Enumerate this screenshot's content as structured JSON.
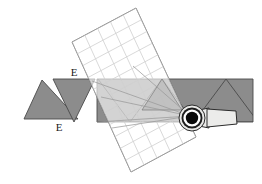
{
  "figure": {
    "background_color": "#ffffff",
    "width": 262,
    "height": 184
  },
  "colors": {
    "triangle_fill": "#8c8c8c",
    "triangle_stroke": "#4a4a4a",
    "band_fill": "#8c8c8c",
    "band_stroke": "#4a4a4a",
    "overlap_fill": "#bdbdbd",
    "grid_line": "#cfcfcf",
    "grid_border": "#6e6e6e",
    "grid_fill": "#ffffff",
    "ray_line": "#9a9a9a",
    "eye_outer": "#e8e8e6",
    "eye_ring": "#2b2b2b",
    "eye_white": "#ffffff",
    "eye_pupil": "#0a0a0a",
    "barrel_fill": "#ececea",
    "barrel_stroke": "#2b2b2b",
    "label_color": "#1a1a1a"
  },
  "labels": [
    {
      "id": "label-e-lower-left",
      "text": "E",
      "x": 59,
      "y": 131
    },
    {
      "id": "label-e-upper",
      "text": "E",
      "x": 74,
      "y": 76
    }
  ],
  "shapes": {
    "triangle_up_left": {
      "name": "object-triangle-upright",
      "points": "42,80 78,119 24,119"
    },
    "triangle_down_left": {
      "name": "object-triangle-inverted",
      "points": "53,79 95,79 74,122"
    },
    "band": {
      "name": "image-strip-band",
      "points": "97,79 253,79 253,122 97,122"
    },
    "band_triangles": [
      {
        "name": "band-triangle-1",
        "points": "130,122 162,79 194,122"
      },
      {
        "name": "band-triangle-2",
        "points": "194,122 226,79 253,115"
      },
      {
        "name": "band-triangle-edge",
        "points": "97,122 118,79 130,122"
      }
    ],
    "grid_sheet": {
      "name": "grid-plane-sheet",
      "points": "72,42 136,8 196,137 131,172",
      "rows": 11,
      "cols": 5
    },
    "overlap_triangle": {
      "name": "grid-triangle-overlap",
      "points": "142,110 162,79 182,110"
    },
    "rays": [
      {
        "name": "ray-1",
        "from_x": 190,
        "from_y": 116,
        "to_x": 92,
        "to_y": 81
      },
      {
        "name": "ray-2",
        "from_x": 190,
        "from_y": 116,
        "to_x": 101,
        "to_y": 97
      },
      {
        "name": "ray-3",
        "from_x": 190,
        "from_y": 116,
        "to_x": 97,
        "to_y": 122
      },
      {
        "name": "ray-4",
        "from_x": 190,
        "from_y": 116,
        "to_x": 112,
        "to_y": 128
      },
      {
        "name": "ray-5",
        "from_x": 190,
        "from_y": 116,
        "to_x": 133,
        "to_y": 66
      }
    ],
    "eye": {
      "name": "observer-eye",
      "cx": 192,
      "cy": 118,
      "outer_rx": 13,
      "outer_ry": 13,
      "ring_r": 10,
      "white_r": 9,
      "pupil_r": 6
    },
    "barrel": {
      "name": "eye-barrel-body",
      "points": "204,110 236,112 238,124 206,127",
      "neck": "200,112 208,110 208,126 200,124"
    }
  }
}
